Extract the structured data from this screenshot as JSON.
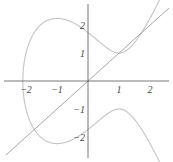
{
  "chart_data": {
    "type": "line",
    "title": "",
    "xlabel": "",
    "ylabel": "",
    "xlim": [
      -2.8,
      2.6
    ],
    "ylim": [
      -2.8,
      2.9
    ],
    "grid": false,
    "x_ticks": [
      -2,
      -1,
      1,
      2
    ],
    "y_ticks": [
      2,
      1,
      -1,
      -2
    ],
    "x_tick_labels": [
      "−2",
      "−1",
      "1",
      "2"
    ],
    "y_tick_labels": [
      "2",
      "1",
      "−1",
      "−2"
    ],
    "series": [
      {
        "name": "elliptic curve y^2 = x^3 - 3x + 3",
        "color": "#c4c4c4",
        "equation": "y^2 = x^3 - 3x + 3"
      },
      {
        "name": "line y = x",
        "color": "#9c9c9c",
        "equation": "y = x"
      }
    ]
  },
  "colors": {
    "axis": "#555555",
    "curve": "#c4c4c4",
    "line": "#9c9c9c"
  }
}
